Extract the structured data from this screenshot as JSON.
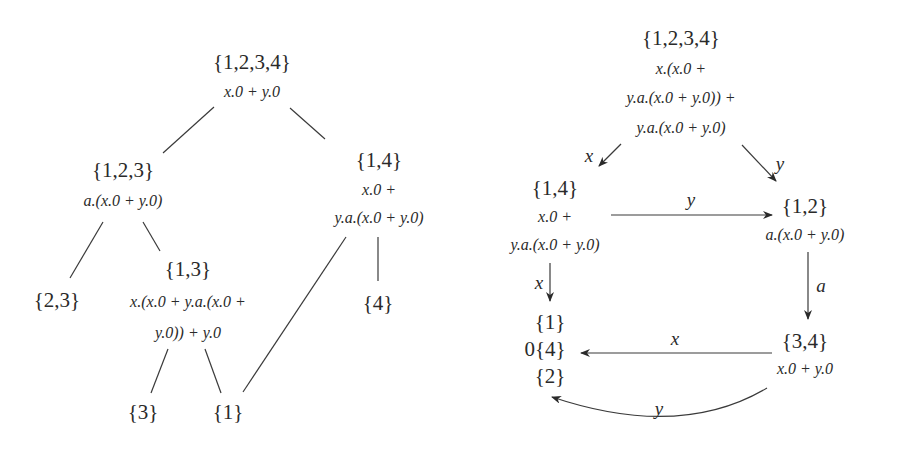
{
  "left_tree": {
    "nodes": [
      {
        "id": "n1234",
        "set": "{1,2,3,4}",
        "expr": [
          "x.0 + y.0"
        ]
      },
      {
        "id": "n123",
        "set": "{1,2,3}",
        "expr": [
          "a.(x.0 + y.0)"
        ]
      },
      {
        "id": "n14",
        "set": "{1,4}",
        "expr": [
          "x.0 +",
          "y.a.(x.0 + y.0)"
        ]
      },
      {
        "id": "n23",
        "set": "{2,3}",
        "expr": []
      },
      {
        "id": "n13",
        "set": "{1,3}",
        "expr": [
          "x.(x.0 + y.a.(x.0 +",
          "y.0)) + y.0"
        ]
      },
      {
        "id": "n4",
        "set": "{4}",
        "expr": []
      },
      {
        "id": "n3",
        "set": "{3}",
        "expr": []
      },
      {
        "id": "n1",
        "set": "{1}",
        "expr": []
      }
    ],
    "edges": [
      [
        "n1234",
        "n123"
      ],
      [
        "n1234",
        "n14"
      ],
      [
        "n123",
        "n23"
      ],
      [
        "n123",
        "n13"
      ],
      [
        "n14",
        "n4"
      ],
      [
        "n14",
        "n1"
      ],
      [
        "n13",
        "n3"
      ],
      [
        "n13",
        "n1"
      ]
    ]
  },
  "right_graph": {
    "nodes": [
      {
        "id": "r1234",
        "set": "{1,2,3,4}",
        "expr": [
          "x.(x.0 +",
          "y.a.(x.0 + y.0)) +",
          "y.a.(x.0 + y.0)"
        ]
      },
      {
        "id": "r14",
        "set": "{1,4}",
        "expr": [
          "x.0 +",
          "y.a.(x.0 + y.0)"
        ]
      },
      {
        "id": "r12",
        "set": "{1,2}",
        "expr": [
          "a.(x.0 + y.0)"
        ]
      },
      {
        "id": "rbottom",
        "set_lines": [
          "{1}",
          "0{4}",
          "{2}"
        ]
      },
      {
        "id": "r34",
        "set": "{3,4}",
        "expr": [
          "x.0 + y.0"
        ]
      }
    ],
    "edges": [
      {
        "from": "r1234",
        "to": "r14",
        "label": "x"
      },
      {
        "from": "r1234",
        "to": "r12",
        "label": "y"
      },
      {
        "from": "r14",
        "to": "r12",
        "label": "y"
      },
      {
        "from": "r14",
        "to": "rbottom",
        "label": "x"
      },
      {
        "from": "r12",
        "to": "r34",
        "label": "a"
      },
      {
        "from": "r34",
        "to": "rbottom",
        "label": "x"
      },
      {
        "from": "r34",
        "to": "rbottom",
        "label": "y"
      }
    ]
  }
}
